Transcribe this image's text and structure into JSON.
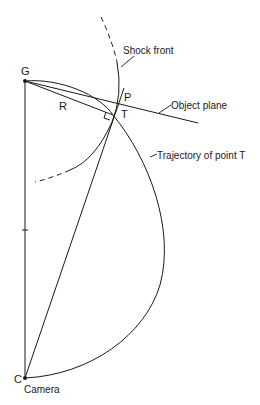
{
  "diagram": {
    "title_fragment": "... y ... p",
    "points": {
      "G": {
        "label": "G",
        "x": 25,
        "y": 81
      },
      "C": {
        "label": "C",
        "x": 25,
        "y": 378
      },
      "P": {
        "label": "P",
        "x": 119,
        "y": 106
      },
      "T": {
        "label": "T",
        "x": 113,
        "y": 115
      }
    },
    "labels": {
      "shock_front": "Shock front",
      "object_plane": "Object plane",
      "trajectory": "Trajectory of point T",
      "camera": "Camera",
      "R": "R"
    },
    "colors": {
      "line": "#1a1a1a",
      "background": "#ffffff"
    }
  }
}
